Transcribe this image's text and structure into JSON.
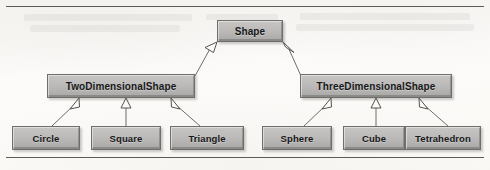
{
  "diagram": {
    "type": "uml-class-inheritance-hierarchy",
    "root": {
      "label": "Shape",
      "box": {
        "x": 217,
        "y": 20,
        "w": 66,
        "h": 22,
        "font": 10
      }
    },
    "level2": [
      {
        "id": "two-dimensional-shape",
        "label": "TwoDimensionalShape",
        "box": {
          "x": 47,
          "y": 74,
          "w": 148,
          "h": 24,
          "font": 10
        }
      },
      {
        "id": "three-dimensional-shape",
        "label": "ThreeDimensionalShape",
        "box": {
          "x": 300,
          "y": 74,
          "w": 152,
          "h": 24,
          "font": 10
        }
      }
    ],
    "leaves": [
      {
        "id": "circle",
        "label": "Circle",
        "box": {
          "x": 12,
          "y": 126,
          "w": 68,
          "h": 24,
          "font": 9.5
        }
      },
      {
        "id": "square",
        "label": "Square",
        "box": {
          "x": 91,
          "y": 126,
          "w": 70,
          "h": 24,
          "font": 9.5
        }
      },
      {
        "id": "triangle",
        "label": "Triangle",
        "box": {
          "x": 170,
          "y": 126,
          "w": 74,
          "h": 24,
          "font": 9.5
        }
      },
      {
        "id": "sphere",
        "label": "Sphere",
        "box": {
          "x": 262,
          "y": 126,
          "w": 70,
          "h": 24,
          "font": 9.5
        }
      },
      {
        "id": "cube",
        "label": "Cube",
        "box": {
          "x": 343,
          "y": 126,
          "w": 62,
          "h": 24,
          "font": 9.5
        }
      },
      {
        "id": "tetrahedron",
        "label": "Tetrahedron",
        "box": {
          "x": 405,
          "y": 126,
          "w": 76,
          "h": 24,
          "font": 9.5
        }
      }
    ],
    "edges": [
      {
        "from": "two-dimensional-shape",
        "to": "Shape"
      },
      {
        "from": "three-dimensional-shape",
        "to": "Shape"
      },
      {
        "from": "circle",
        "to": "two-dimensional-shape"
      },
      {
        "from": "square",
        "to": "two-dimensional-shape"
      },
      {
        "from": "triangle",
        "to": "two-dimensional-shape"
      },
      {
        "from": "sphere",
        "to": "three-dimensional-shape"
      },
      {
        "from": "cube",
        "to": "three-dimensional-shape"
      },
      {
        "from": "tetrahedron",
        "to": "three-dimensional-shape"
      }
    ]
  },
  "page": {
    "background_color": "#fbfaf8",
    "rule_color": "#5d5b58",
    "node_fill_color": "#bcbbb9",
    "node_border_color": "#6f6e6c",
    "edge_color": "#6e6c69",
    "text_color": "#18181a"
  }
}
